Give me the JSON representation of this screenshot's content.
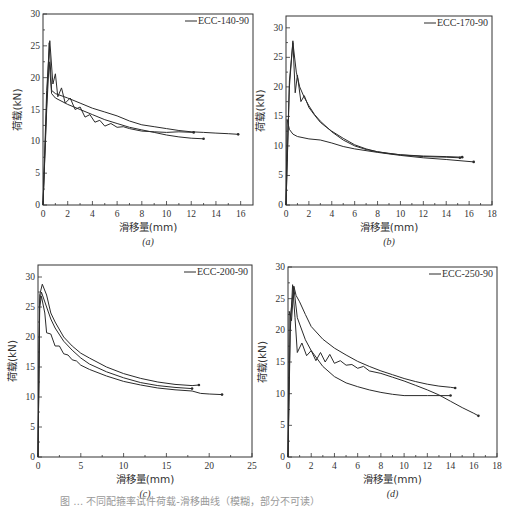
{
  "figure": {
    "caption": "图 … 不同配箍率试件荷载-滑移曲线（模糊，部分不可读）"
  },
  "chart_data": [
    {
      "id": "a",
      "type": "line",
      "sublabel": "(a)",
      "legend": "ECC-140-90",
      "xlabel": "滑移量(mm)",
      "ylabel": "荷载(kN)",
      "xlim": [
        0,
        17
      ],
      "ylim": [
        0,
        30
      ],
      "xticks": [
        0,
        2,
        4,
        6,
        8,
        10,
        12,
        14,
        16
      ],
      "yticks": [
        0,
        5,
        10,
        15,
        20,
        25,
        30
      ],
      "frame": {
        "x0": 43,
        "y0": 14,
        "x1": 253,
        "y1": 205
      },
      "series": [
        {
          "name": "specimen-1",
          "x": [
            0,
            0.3,
            0.5,
            0.7,
            1.0,
            2,
            3,
            4,
            5,
            6,
            7,
            8,
            9,
            10,
            11,
            12,
            13,
            14,
            15,
            15.8
          ],
          "y": [
            0,
            16,
            25.5,
            18,
            17.5,
            16.8,
            16,
            15.2,
            14.6,
            14,
            13.2,
            12.6,
            12.3,
            12,
            11.7,
            11.5,
            11.4,
            11.3,
            11.2,
            11.1
          ]
        },
        {
          "name": "specimen-2",
          "x": [
            0,
            0.3,
            0.55,
            0.8,
            1.0,
            1.2,
            1.5,
            1.8,
            2.2,
            2.6,
            3,
            3.4,
            3.8,
            4.2,
            4.6,
            5,
            5.5,
            6,
            6.5,
            7,
            8,
            9,
            10,
            11,
            12.2
          ],
          "y": [
            0,
            18,
            25.8,
            19,
            20.6,
            17,
            18.4,
            16,
            16.8,
            15,
            15.4,
            13.8,
            14.2,
            13,
            13.3,
            12.4,
            12.8,
            12.2,
            12.3,
            12,
            11.6,
            11.5,
            11.4,
            11.5,
            11.4
          ]
        },
        {
          "name": "specimen-3",
          "x": [
            0,
            0.3,
            0.5,
            0.7,
            1,
            2,
            3,
            4,
            5,
            6,
            7,
            8,
            9,
            10,
            11,
            12,
            13
          ],
          "y": [
            0,
            15,
            22.5,
            17.5,
            16.8,
            15.8,
            15,
            14.2,
            13.4,
            12.8,
            12.2,
            11.8,
            11.4,
            11,
            10.7,
            10.5,
            10.4
          ]
        }
      ]
    },
    {
      "id": "b",
      "type": "line",
      "sublabel": "(b)",
      "legend": "ECC-170-90",
      "xlabel": "滑移量(mm)",
      "ylabel": "荷载(kN)",
      "xlim": [
        0,
        18
      ],
      "ylim": [
        0,
        32
      ],
      "xticks": [
        0,
        2,
        4,
        6,
        8,
        10,
        12,
        14,
        16,
        18
      ],
      "yticks": [
        0,
        5,
        10,
        15,
        20,
        25,
        30
      ],
      "frame": {
        "x0": 286,
        "y0": 16,
        "x1": 492,
        "y1": 205
      },
      "series": [
        {
          "name": "specimen-1",
          "x": [
            0,
            0.3,
            0.6,
            0.8,
            1.0,
            1.3,
            1.6,
            2,
            2.5,
            3,
            3.5,
            4,
            5,
            6,
            7,
            8,
            9,
            10,
            12,
            14,
            15.4
          ],
          "y": [
            0,
            20,
            27.8,
            19,
            22,
            17.5,
            18.5,
            16.5,
            15.2,
            14,
            13.2,
            12.5,
            11.3,
            10.2,
            9.5,
            9,
            8.7,
            8.5,
            8.3,
            8.2,
            8.1
          ]
        },
        {
          "name": "specimen-2",
          "x": [
            0,
            0.3,
            0.6,
            0.9,
            1.2,
            1.6,
            2,
            2.5,
            3,
            4,
            5,
            6,
            7,
            8,
            10,
            12,
            14,
            15.2
          ],
          "y": [
            0,
            21,
            27.5,
            22.5,
            20,
            18.2,
            16.8,
            15.3,
            14.2,
            12.4,
            11,
            10,
            9.4,
            9,
            8.5,
            8.2,
            8.1,
            8
          ]
        },
        {
          "name": "specimen-3",
          "x": [
            0,
            0.1,
            0.3,
            0.6,
            1,
            2,
            3,
            4,
            5,
            6,
            8,
            10,
            12,
            14,
            16.4
          ],
          "y": [
            0,
            14.5,
            12.8,
            12,
            11.6,
            11.2,
            11,
            10.5,
            9.9,
            9.5,
            8.9,
            8.4,
            8,
            7.7,
            7.3
          ]
        }
      ]
    },
    {
      "id": "c",
      "type": "line",
      "sublabel": "(c)",
      "legend": "ECC-200-90",
      "xlabel": "滑移量(mm)",
      "ylabel": "荷载(kN)",
      "xlim": [
        0,
        25
      ],
      "ylim": [
        0,
        32
      ],
      "xticks": [
        0,
        5,
        10,
        15,
        20,
        25
      ],
      "yticks": [
        0,
        5,
        10,
        15,
        20,
        25,
        30
      ],
      "frame": {
        "x0": 38,
        "y0": 265,
        "x1": 252,
        "y1": 457
      },
      "series": [
        {
          "name": "specimen-1",
          "x": [
            0,
            0.2,
            0.5,
            1,
            1.5,
            2,
            3,
            4,
            5,
            6,
            8,
            10,
            12,
            14,
            16,
            18,
            18.8
          ],
          "y": [
            0,
            27,
            28.8,
            27,
            24,
            22.5,
            20,
            18.5,
            17.3,
            16.5,
            15,
            13.9,
            13.1,
            12.5,
            12.1,
            11.9,
            12
          ]
        },
        {
          "name": "specimen-2",
          "x": [
            0,
            0.2,
            0.4,
            1,
            1.5,
            2,
            3,
            4,
            5,
            6,
            8,
            10,
            12,
            14,
            16,
            18
          ],
          "y": [
            0,
            26,
            27.5,
            25,
            23,
            21.5,
            19.3,
            17.8,
            16.5,
            15.5,
            14.2,
            13.2,
            12.4,
            11.9,
            11.6,
            11.4
          ]
        },
        {
          "name": "specimen-3",
          "x": [
            0,
            0.2,
            0.4,
            0.8,
            1,
            1.5,
            2,
            2.5,
            3,
            3.5,
            4,
            4.5,
            5,
            6,
            8,
            10,
            12,
            14,
            16,
            18,
            19,
            20,
            21.5
          ],
          "y": [
            0,
            25,
            26.8,
            24,
            20.7,
            20.5,
            18.5,
            18.5,
            17.2,
            17,
            16.2,
            16,
            15.3,
            14.6,
            13.5,
            12.6,
            12,
            11.5,
            11.2,
            11,
            10.6,
            10.5,
            10.4
          ]
        }
      ]
    },
    {
      "id": "d",
      "type": "line",
      "sublabel": "(d)",
      "legend": "ECC-250-90",
      "xlabel": "滑移量(mm)",
      "ylabel": "荷载(kN)",
      "xlim": [
        0,
        18
      ],
      "ylim": [
        0,
        30
      ],
      "xticks": [
        0,
        2,
        4,
        6,
        8,
        10,
        12,
        14,
        16,
        18
      ],
      "yticks": [
        0,
        5,
        10,
        15,
        20,
        25,
        30
      ],
      "frame": {
        "x0": 288,
        "y0": 267,
        "x1": 497,
        "y1": 457
      },
      "series": [
        {
          "name": "specimen-1",
          "x": [
            0,
            0.2,
            0.5,
            0.7,
            1,
            1.5,
            2,
            3,
            4,
            5,
            6,
            7,
            8,
            9,
            10,
            11,
            12,
            13,
            14,
            14.4
          ],
          "y": [
            0,
            22,
            27,
            25.5,
            24.5,
            22.5,
            20.6,
            18.6,
            17.2,
            16.1,
            15.1,
            14.3,
            13.6,
            13,
            12.4,
            11.9,
            11.5,
            11.2,
            11,
            10.9
          ]
        },
        {
          "name": "specimen-2",
          "x": [
            0,
            0.2,
            0.4,
            0.6,
            0.8,
            1.2,
            1.6,
            2,
            2.4,
            2.8,
            3.2,
            3.6,
            4,
            4.5,
            5,
            5.5,
            6,
            6.5,
            7,
            8,
            9,
            10,
            11,
            12,
            13,
            14,
            15,
            16,
            16.4
          ],
          "y": [
            0,
            20,
            27.2,
            22,
            16.5,
            18,
            16,
            16.8,
            15.2,
            16.5,
            15,
            16.2,
            14.8,
            15.2,
            14.5,
            14.6,
            14,
            14.3,
            13.6,
            13.2,
            12.6,
            12,
            11.3,
            10.6,
            9.8,
            8.8,
            7.8,
            6.9,
            6.5
          ]
        },
        {
          "name": "specimen-3",
          "x": [
            0,
            0.1,
            0.3,
            0.5,
            0.8,
            1,
            1.5,
            2,
            3,
            4,
            5,
            6,
            7,
            8,
            9,
            10,
            12,
            14
          ],
          "y": [
            0,
            23,
            21.5,
            26.8,
            22,
            21,
            18.5,
            16.8,
            14.3,
            12.7,
            11.7,
            11.1,
            10.6,
            10.2,
            9.9,
            9.7,
            9.7,
            9.7
          ]
        }
      ]
    }
  ]
}
